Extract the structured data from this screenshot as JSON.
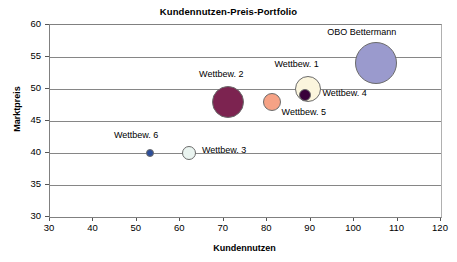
{
  "chart_data": {
    "type": "scatter",
    "title": "Kundennutzen-Preis-Portfolio",
    "xlabel": "Kundennutzen",
    "ylabel": "Marktpreis",
    "xlim": [
      30,
      120
    ],
    "ylim": [
      30,
      60
    ],
    "xticks": [
      "30",
      "40",
      "50",
      "60",
      "70",
      "80",
      "90",
      "100",
      "110",
      "120"
    ],
    "yticks": [
      "60",
      "55",
      "50",
      "45",
      "40",
      "35",
      "30"
    ],
    "grid": "horizontal",
    "legend": "none (direct point labels)",
    "points": [
      {
        "label": "OBO Bettermann",
        "x": 105,
        "y": 54,
        "size": 21,
        "color": "#9a9acd",
        "label_dx": -13,
        "label_dy": -30
      },
      {
        "label": "Wettbew. 1",
        "x": 89.5,
        "y": 50,
        "size": 13,
        "color": "#fbf5dd",
        "label_dx": -11,
        "label_dy": -24
      },
      {
        "label": "Wettbew. 4",
        "x": 88.8,
        "y": 49,
        "size": 6,
        "color": "#39003a",
        "label_dx": 16,
        "label_dy": -1
      },
      {
        "label": "Wettbew. 5",
        "x": 81,
        "y": 48,
        "size": 9,
        "color": "#f6a285",
        "label_dx": 6,
        "label_dy": 11
      },
      {
        "label": "Wettbew. 2",
        "x": 71,
        "y": 48,
        "size": 16,
        "color": "#7c2350",
        "label_dx": -6,
        "label_dy": -27
      },
      {
        "label": "Wettbew. 3",
        "x": 62,
        "y": 40,
        "size": 7,
        "color": "#eaf4f0",
        "label_dx": 11,
        "label_dy": -2
      },
      {
        "label": "Wettbew. 6",
        "x": 53,
        "y": 40,
        "size": 4,
        "color": "#2c4e9a",
        "label_dx": -13,
        "label_dy": -17
      }
    ]
  }
}
